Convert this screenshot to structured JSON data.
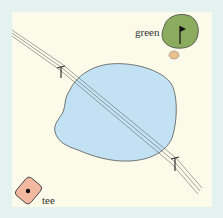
{
  "diagram": {
    "type": "golf-hole-map",
    "labels": {
      "green": "green",
      "tee": "tee"
    },
    "elements": [
      {
        "name": "tee",
        "shape": "rounded-diamond",
        "fill": "#f2b8a0"
      },
      {
        "name": "green",
        "shape": "blob",
        "fill": "#8bab5f",
        "has_flag": true
      },
      {
        "name": "bunker",
        "shape": "oval",
        "fill": "#e9c08c"
      },
      {
        "name": "pond",
        "shape": "blob",
        "fill": "#c2e2f4"
      },
      {
        "name": "bridge",
        "shape": "double-line path",
        "posts": 2
      }
    ],
    "colors": {
      "background": "#fcfbea",
      "border": "#e4f2ef",
      "water": "#c2e2f4",
      "green": "#8bab5f",
      "bunker": "#e9c08c",
      "tee": "#f2b8a0",
      "stroke": "#444444"
    }
  }
}
